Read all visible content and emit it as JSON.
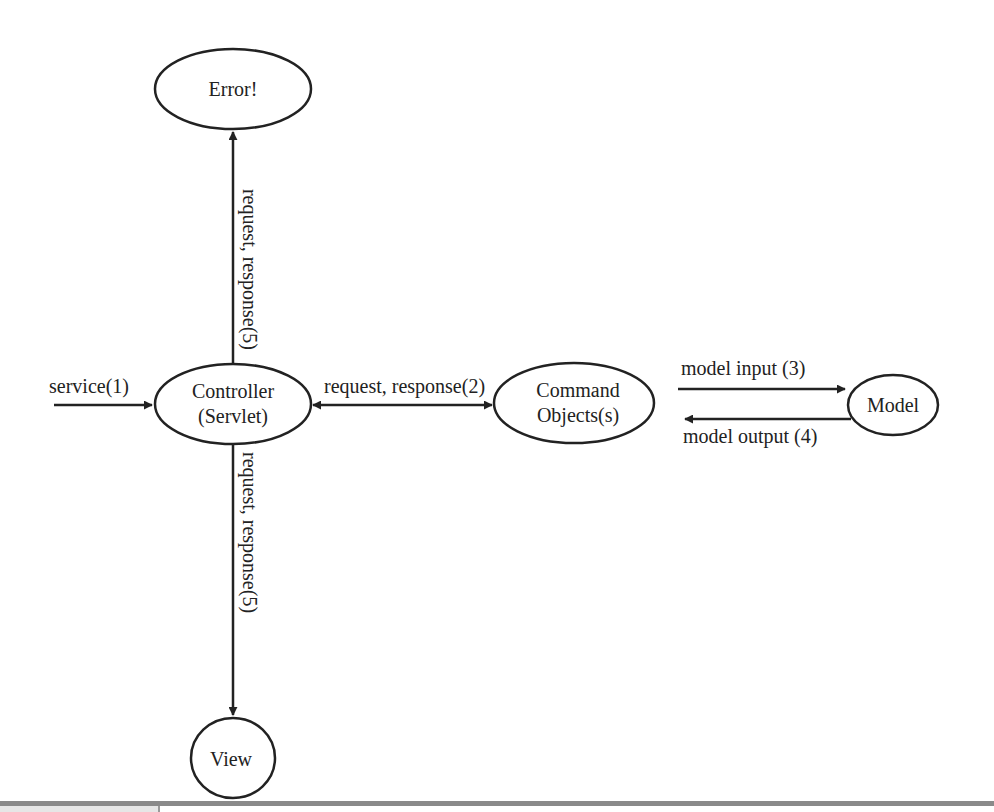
{
  "diagram": {
    "nodes": {
      "error": {
        "label": "Error!"
      },
      "controller": {
        "line1": "Controller",
        "line2": "(Servlet)"
      },
      "command": {
        "line1": "Command",
        "line2": "Objects(s)"
      },
      "model": {
        "label": "Model"
      },
      "view": {
        "label": "View"
      }
    },
    "edges": {
      "service": "service(1)",
      "controller_command": "request, response(2)",
      "model_input": "model input (3)",
      "model_output": "model output (4)",
      "controller_error": "request, response(5)",
      "controller_view": "request, response(5)"
    }
  }
}
